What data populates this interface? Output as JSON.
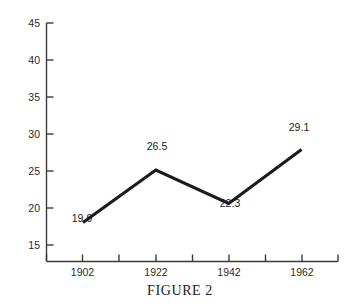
{
  "figure": {
    "caption": "FIGURE 2"
  },
  "chart_data": {
    "type": "line",
    "title": "",
    "xlabel": "",
    "ylabel": "",
    "categories": [
      "1902",
      "1922",
      "1942",
      "1962"
    ],
    "x": [
      1902,
      1922,
      1942,
      1962
    ],
    "values": [
      19.9,
      26.5,
      22.3,
      29.1
    ],
    "point_labels": [
      "19.9",
      "26.5",
      "22.3",
      "29.1"
    ],
    "ylim": [
      15,
      45
    ],
    "xlim": [
      1892,
      1972
    ],
    "y_ticks": [
      15,
      20,
      25,
      30,
      35,
      40,
      45
    ],
    "y_tick_labels": [
      "15",
      "20",
      "25",
      "30",
      "35",
      "40",
      "45"
    ],
    "x_ticks": [
      1892,
      1902,
      1912,
      1922,
      1932,
      1942,
      1952,
      1962,
      1972
    ],
    "x_tick_labels": [
      "",
      "1902",
      "",
      "1922",
      "",
      "1942",
      "",
      "1962",
      ""
    ],
    "grid": false,
    "legend": false,
    "line_color": "#1b1b1b",
    "axis_color": "#3a3a3a",
    "background": "#ffffff"
  }
}
